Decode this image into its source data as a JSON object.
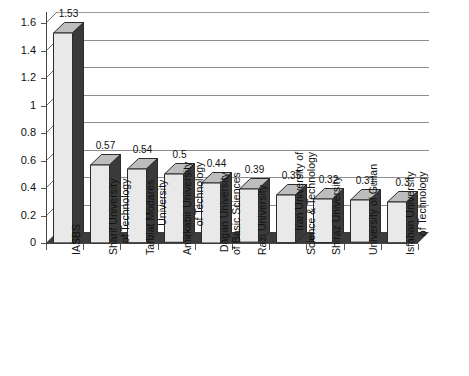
{
  "chart_data": {
    "type": "bar",
    "title": "",
    "subtitle": "",
    "xlabel": "",
    "ylabel": "",
    "ylim": [
      0,
      1.6
    ],
    "y_ticks": [
      "0",
      "0.2",
      "0.4",
      "0.6",
      "0.8",
      "1",
      "1.2",
      "1.4",
      "1.6"
    ],
    "y_tick_values": [
      0,
      0.2,
      0.4,
      0.6,
      0.8,
      1.0,
      1.2,
      1.4,
      1.6
    ],
    "grid": true,
    "legend": false,
    "legend_position": "none",
    "style": "3d-bar",
    "categories": [
      "IASBS",
      "Sharif University of Technology",
      "Tarbiat Modares University",
      "Amirkabir University of Technology",
      "Dagan University of Basic Sciences",
      "Razi University",
      "Iran University of Science & Technology",
      "Shiraz University",
      "University of Guilan",
      "Isfahan University of Technology"
    ],
    "category_lines": [
      [
        "IASBS"
      ],
      [
        "Sharif University",
        "of Technology"
      ],
      [
        "Tarbiat Modares",
        "University"
      ],
      [
        "Amirkabir University",
        "of Technology"
      ],
      [
        "Dagan University",
        "of Basic Sciences"
      ],
      [
        "Razi University"
      ],
      [
        "Iran University of",
        "Science & Technology"
      ],
      [
        "Shiraz University"
      ],
      [
        "University of Guilan"
      ],
      [
        "Isfahan University",
        "of Technology"
      ]
    ],
    "values": [
      1.53,
      0.57,
      0.54,
      0.5,
      0.44,
      0.39,
      0.35,
      0.32,
      0.31,
      0.3
    ],
    "value_labels": [
      "1.53",
      "0.57",
      "0.54",
      "0.5",
      "0.44",
      "0.39",
      "0.35",
      "0.32",
      "0.31",
      "0.3"
    ],
    "colors": {
      "bar_front": "#e9e9e9",
      "bar_side": "#3a3a3a",
      "bar_top": "#bdbdbd",
      "bar_outline": "#2b2b2b",
      "gridline": "#8e8e8e",
      "axis": "#444444",
      "floor": "#3c3c3c",
      "text": "#111111",
      "background": "#ffffff"
    }
  }
}
